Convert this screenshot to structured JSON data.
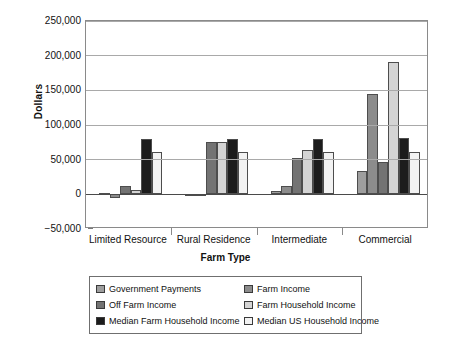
{
  "chart_data": {
    "type": "bar",
    "title": "",
    "xlabel": "Farm Type",
    "ylabel": "Dollars",
    "categories": [
      "Limited Resource",
      "Rural Residence",
      "Intermediate",
      "Commercial"
    ],
    "ylim": [
      -50000,
      250000
    ],
    "yticks": [
      -50000,
      0,
      50000,
      100000,
      150000,
      200000,
      250000
    ],
    "ytick_labels": [
      "−50,000",
      "0",
      "50,000",
      "100,000",
      "150,000",
      "200,000",
      "250,000"
    ],
    "grid": true,
    "legend_position": "bottom",
    "series": [
      {
        "name": "Government  Payments",
        "color": "#9e9e9e",
        "values": [
          1500,
          1000,
          5000,
          34000
        ]
      },
      {
        "name": "Farm Income",
        "color": "#8c8c8c",
        "values": [
          -6000,
          500,
          12000,
          145000
        ]
      },
      {
        "name": "Off Farm Income",
        "color": "#737373",
        "values": [
          12000,
          75000,
          52000,
          47000
        ]
      },
      {
        "name": "Farm Household Income",
        "color": "#d4d4d4",
        "values": [
          6000,
          75000,
          64000,
          191000
        ]
      },
      {
        "name": "Median Farm Household Income",
        "color": "#1c1c1c",
        "values": [
          80000,
          80000,
          80000,
          81000
        ]
      },
      {
        "name": "Median US Household Income",
        "color": "#f2f2f2",
        "values": [
          61000,
          61000,
          61000,
          61000
        ]
      }
    ]
  }
}
